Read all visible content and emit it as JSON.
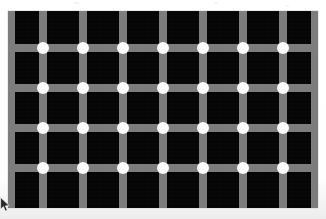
{
  "document": {
    "title": "Scintillating Grid Illusion",
    "kind": "optical-illusion-image",
    "alt_text": "Black squares separated by gray lines with white dots at the intersections"
  },
  "canvas": {
    "width": 326,
    "height": 219,
    "background_color": "#fdfdfd"
  },
  "figure": {
    "left": 8,
    "top": 11,
    "width": 310,
    "height": 197,
    "square_color": "#050505",
    "line_color": "#7c7c7c",
    "dot_color": "#fbfbfb",
    "line_thickness": 8,
    "dot_diameter": 12,
    "cell_pitch": 40,
    "vertical_line_centers": [
      3,
      35,
      75,
      115,
      155,
      195,
      235,
      275,
      307
    ],
    "horizontal_line_centers": [
      37,
      77,
      117,
      157
    ],
    "dot_columns": [
      35,
      75,
      115,
      155,
      195,
      235,
      275
    ],
    "dot_rows": [
      37,
      77,
      117,
      157
    ],
    "dot_count": 28,
    "column_count": 7,
    "row_count": 4
  },
  "cursor": {
    "icon": "mouse-pointer-icon",
    "x": 0,
    "y": 197,
    "color": "#2a2a2a"
  },
  "specks": [
    {
      "x": 74,
      "y": 2,
      "w": 5,
      "h": 2
    },
    {
      "x": 214,
      "y": 2,
      "w": 4,
      "h": 2
    },
    {
      "x": 286,
      "y": 5,
      "w": 3,
      "h": 2
    }
  ]
}
